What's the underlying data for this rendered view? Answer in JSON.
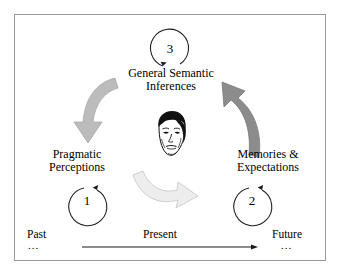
{
  "diagram": {
    "title_nodes": {
      "top": {
        "line1": "General Semantic",
        "line2": "Inferences"
      },
      "left": {
        "line1": "Pragmatic",
        "line2": "Perceptions"
      },
      "right": {
        "line1": "Memories &",
        "line2": "Expectations"
      }
    },
    "cycle_markers": [
      {
        "id": "marker-3",
        "label": "3",
        "position": "top",
        "direction": "counterclockwise"
      },
      {
        "id": "marker-1",
        "label": "1",
        "position": "bottom-left",
        "direction": "clockwise"
      },
      {
        "id": "marker-2",
        "label": "2",
        "position": "bottom-right",
        "direction": "clockwise"
      }
    ],
    "timeline": {
      "past_label": "Past",
      "past_ellipsis": "...",
      "present_label": "Present",
      "future_label": "Future",
      "future_ellipsis": "..."
    },
    "flow_arrows": [
      {
        "id": "arrow-top-to-left",
        "from": "General Semantic Inferences",
        "to": "Pragmatic Perceptions",
        "color": "#bcbcbc"
      },
      {
        "id": "arrow-left-to-right",
        "from": "Pragmatic Perceptions",
        "to": "Memories & Expectations",
        "color": "#ededed"
      },
      {
        "id": "arrow-right-to-top",
        "from": "Memories & Expectations",
        "to": "General Semantic Inferences",
        "color": "#8c8c8c"
      }
    ],
    "center_image": {
      "name": "child-face-illustration",
      "alt": "line drawing of a child's face"
    },
    "colors": {
      "border": "#9a9a9a",
      "background": "#ffffff",
      "text": "#000000",
      "arrow_light": "#ededed",
      "arrow_mid": "#bcbcbc",
      "arrow_dark": "#8c8c8c"
    }
  }
}
